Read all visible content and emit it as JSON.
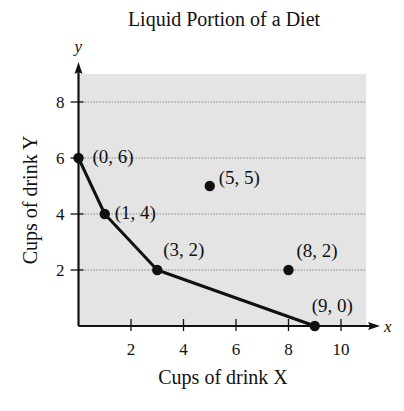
{
  "chart_data": {
    "type": "line",
    "title": "Liquid Portion of a Diet",
    "xlabel": "Cups of drink X",
    "ylabel": "Cups of drink Y",
    "x_axis_letter": "x",
    "y_axis_letter": "y",
    "xlim": [
      0,
      11
    ],
    "ylim": [
      0,
      9
    ],
    "x_ticks": [
      2,
      4,
      6,
      8,
      10
    ],
    "y_ticks": [
      2,
      4,
      6,
      8
    ],
    "grid": "horizontal dotted at y ticks",
    "shaded_region": {
      "x": [
        0,
        11
      ],
      "y": [
        0,
        9
      ],
      "color": "#e4e4e4"
    },
    "series": [
      {
        "name": "boundary",
        "style": "solid line with markers",
        "points": [
          [
            0,
            6
          ],
          [
            1,
            4
          ],
          [
            3,
            2
          ],
          [
            9,
            0
          ]
        ]
      },
      {
        "name": "isolated points",
        "style": "markers only",
        "points": [
          [
            5,
            5
          ],
          [
            8,
            2
          ]
        ]
      }
    ],
    "annotations": [
      {
        "text": "(0, 6)",
        "x": 0,
        "y": 6
      },
      {
        "text": "(1, 4)",
        "x": 1,
        "y": 4
      },
      {
        "text": "(3, 2)",
        "x": 3,
        "y": 2
      },
      {
        "text": "(5, 5)",
        "x": 5,
        "y": 5
      },
      {
        "text": "(8, 2)",
        "x": 8,
        "y": 2
      },
      {
        "text": "(9, 0)",
        "x": 9,
        "y": 0
      }
    ],
    "colors": {
      "line": "#111111",
      "grid": "#888888",
      "fill": "#e4e4e4"
    }
  }
}
